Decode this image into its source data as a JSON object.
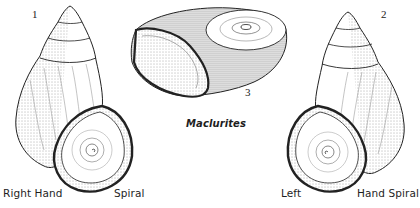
{
  "figure": {
    "panels": [
      {
        "number": "1",
        "name": "right-hand-spiral-shell",
        "label_left": "Right Hand",
        "label_right": "Spiral"
      },
      {
        "number": "2",
        "name": "left-hand-spiral-shell",
        "label_left": "Left",
        "label_right": "Hand Spiral"
      },
      {
        "number": "3",
        "name": "maclurites-shell",
        "caption": "Maclurites"
      }
    ],
    "colors": {
      "ink": "#222222",
      "background": "#ffffff"
    }
  }
}
